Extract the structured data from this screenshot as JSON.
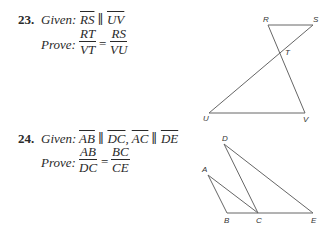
{
  "problems": [
    {
      "number": "23.",
      "given_label": "Given:",
      "given": [
        {
          "seg": "RS"
        },
        {
          "sym": " ∥ "
        },
        {
          "seg": "UV"
        }
      ],
      "prove_label": "Prove:",
      "prove": {
        "left_num": "RT",
        "left_den": "VT",
        "eq": "=",
        "right_num": "RS",
        "right_den": "VU"
      },
      "figure": {
        "points": {
          "R": [
            268,
            25
          ],
          "S": [
            313,
            25
          ],
          "T": [
            280,
            53
          ],
          "U": [
            209,
            113
          ],
          "V": [
            305,
            113
          ]
        },
        "segments": [
          [
            "R",
            "S"
          ],
          [
            "R",
            "V"
          ],
          [
            "S",
            "U"
          ],
          [
            "U",
            "V"
          ]
        ],
        "labels": {
          "R": "R",
          "S": "S",
          "T": "T",
          "U": "U",
          "V": "V"
        }
      }
    },
    {
      "number": "24.",
      "given_label": "Given:",
      "given": [
        {
          "seg": "AB"
        },
        {
          "sym": " ∥ "
        },
        {
          "seg": "DC"
        },
        {
          "sym": ", "
        },
        {
          "seg": "AC"
        },
        {
          "sym": " ∥ "
        },
        {
          "seg": "DE"
        }
      ],
      "prove_label": "Prove:",
      "prove": {
        "left_num": "AB",
        "left_den": "DC",
        "eq": "=",
        "right_num": "BC",
        "right_den": "CE"
      },
      "figure": {
        "points": {
          "A": [
            208,
            175
          ],
          "B": [
            227,
            213
          ],
          "C": [
            258,
            213
          ],
          "D": [
            224,
            144
          ],
          "E": [
            313,
            213
          ]
        },
        "segments": [
          [
            "A",
            "B"
          ],
          [
            "A",
            "C"
          ],
          [
            "D",
            "C"
          ],
          [
            "D",
            "E"
          ],
          [
            "B",
            "E"
          ]
        ],
        "labels": {
          "A": "A",
          "B": "B",
          "C": "C",
          "D": "D",
          "E": "E"
        }
      }
    }
  ]
}
